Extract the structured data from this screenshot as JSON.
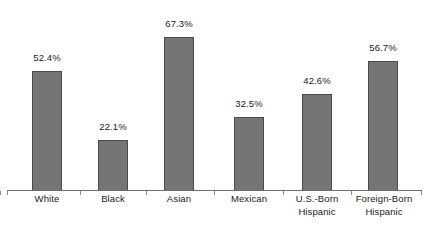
{
  "chart_data": {
    "type": "bar",
    "title": "",
    "subtitle": "",
    "xlabel": "",
    "ylabel": "",
    "ylim": [
      0,
      80
    ],
    "grid": false,
    "legend": false,
    "categories": [
      "White",
      "Black",
      "Asian",
      "Mexican",
      "U.S.-Born Hispanic",
      "Foreign-Born Hispanic"
    ],
    "category_lines": [
      [
        "White"
      ],
      [
        "Black"
      ],
      [
        "Asian"
      ],
      [
        "Mexican"
      ],
      [
        "U.S.-Born",
        "Hispanic"
      ],
      [
        "Foreign-Born",
        "Hispanic"
      ]
    ],
    "values": [
      52.4,
      22.1,
      67.3,
      32.5,
      42.6,
      56.7
    ],
    "value_labels": [
      "52.4%",
      "22.1%",
      "67.3%",
      "32.5%",
      "42.6%",
      "56.7%"
    ],
    "bar_color": "#757575",
    "bar_border_color": "#4a4a4a",
    "axis_color": "#6e6e6e",
    "text_color": "#1a1a1a",
    "background": "#ffffff"
  }
}
